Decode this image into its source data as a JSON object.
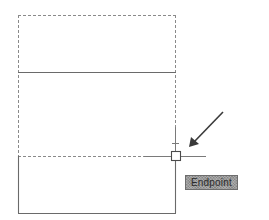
{
  "drawing": {
    "colors": {
      "solid_line": "#6a6a6a",
      "dashed_line": "#8a8a8a",
      "crosshair": "#7a7a7a",
      "marker": "#4a4a4a",
      "arrow": "#3a3a3a",
      "tooltip_bg": "#9a9a9a",
      "tooltip_text": "#2b2b2b"
    },
    "preview_rect": {
      "x1": 18,
      "y1": 15,
      "x2": 176,
      "y2": 156
    },
    "solid_divider_y": 72,
    "base_rect": {
      "x1": 18,
      "y1": 156,
      "x2": 176,
      "y2": 213
    },
    "snap_point": {
      "x": 176,
      "y": 156
    },
    "crosshair": {
      "h_from": 144,
      "h_to": 206,
      "v_top": 127,
      "tick_y": 143
    }
  },
  "osnap": {
    "tooltip_label": "Endpoint",
    "marker_icon": "endpoint-snap-square-icon"
  },
  "annotation": {
    "arrow_icon": "pointer-arrow-icon"
  }
}
